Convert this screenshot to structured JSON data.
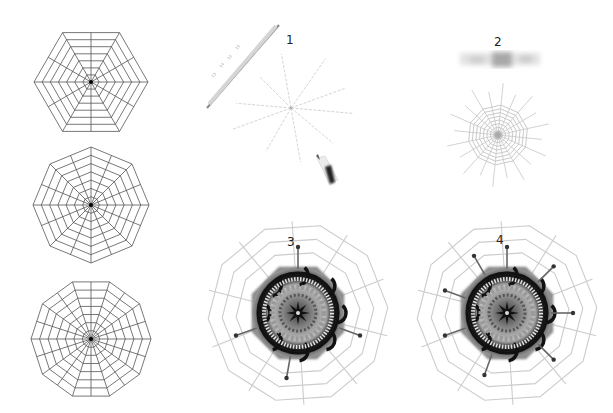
{
  "figure": {
    "templates": [
      {
        "id": "hexagon-web",
        "sides": 6,
        "spokes": 12,
        "rings": 7,
        "cx": 91,
        "cy": 82,
        "r": 57
      },
      {
        "id": "octagon-web",
        "sides": 8,
        "spokes": 16,
        "rings": 7,
        "cx": 91,
        "cy": 205,
        "r": 58
      },
      {
        "id": "decagon-web",
        "sides": 10,
        "spokes": 20,
        "rings": 7,
        "cx": 91,
        "cy": 339,
        "r": 60
      }
    ],
    "steps": [
      {
        "label": "1",
        "caption_visible": false
      },
      {
        "label": "2",
        "caption_visible": false
      },
      {
        "label": "3",
        "caption_visible": false
      },
      {
        "label": "4",
        "caption_visible": false
      }
    ],
    "ruler_ticks": [
      "13",
      "14",
      "15",
      "16"
    ],
    "colors": {
      "line": "#555555",
      "faint_line": "#c8c8c8",
      "doily_dark": "#1a1a1a",
      "doily_mid": "#6e6e6e",
      "background": "#ffffff"
    }
  }
}
